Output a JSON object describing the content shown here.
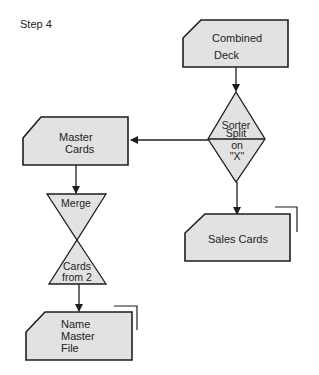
{
  "title": "Step 4",
  "colors": {
    "shape_fill": "#e2e2e2",
    "stroke": "#1e1e1e",
    "text": "#222222",
    "background": "#ffffff"
  },
  "nodes": {
    "combined_deck": {
      "type": "punched-card",
      "line1": "Combined",
      "line2": "Deck"
    },
    "sorter": {
      "type": "decision-diamond",
      "line1": "Sorter",
      "line2": "Split",
      "line3": "on",
      "line4": "\"X\""
    },
    "master_cards": {
      "type": "punched-card",
      "line1": "Master",
      "line2": "Cards"
    },
    "merge": {
      "type": "merge-collate",
      "top_label": "Merge",
      "bottom_line1": "Cards",
      "bottom_line2": "from 2"
    },
    "sales_cards": {
      "type": "punched-card",
      "label": "Sales Cards"
    },
    "name_master_file": {
      "type": "punched-card",
      "line1": "Name",
      "line2": "Master",
      "line3": "File"
    }
  },
  "edges": [
    {
      "from": "Combined Deck",
      "to": "Sorter Split on \"X\""
    },
    {
      "from": "Sorter Split on \"X\"",
      "to": "Master Cards"
    },
    {
      "from": "Sorter Split on \"X\"",
      "to": "Sales Cards"
    },
    {
      "from": "Master Cards",
      "to": "Merge"
    },
    {
      "from": "Merge",
      "to": "Name Master File"
    }
  ]
}
